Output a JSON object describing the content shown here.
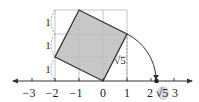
{
  "diagram": {
    "type": "number-line-square-construction",
    "axis": {
      "tick_labels": [
        "−3",
        "−2",
        "−1",
        "0",
        "1",
        "2",
        "3"
      ],
      "tick_values": [
        -3,
        -2,
        -1,
        0,
        1,
        2,
        3
      ]
    },
    "side_labels": [
      "1",
      "1",
      "1"
    ],
    "diagonal_label": "√5",
    "point_label": "√5",
    "point_value": 2.236,
    "colors": {
      "square_fill": "#bdbdbd",
      "square_stroke": "#333333",
      "grid": "#b0b0b0",
      "axis": "#333333",
      "highlight": "#d9d9d9"
    }
  }
}
